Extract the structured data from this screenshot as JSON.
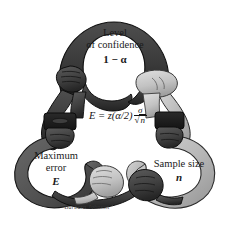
{
  "figure": {
    "background_color": "#ffffff",
    "width": 229,
    "height": 230,
    "signature": "Barbara Johnson"
  },
  "nodes": {
    "confidence": {
      "line1": "Level",
      "line2": "of confidence",
      "symbol": "1 − α",
      "loop_color": "#3a3a3a",
      "loop_shadow": "#1d1d1d"
    },
    "error": {
      "line1": "Maximum",
      "line2": "error",
      "symbol": "E",
      "loop_color": "#565656",
      "loop_shadow": "#2c2c2c"
    },
    "sample": {
      "line1": "Sample size",
      "line2": "",
      "symbol": "n",
      "loop_color": "#b8b8b8",
      "loop_shadow": "#8e8e8e"
    }
  },
  "formula": {
    "lhs": "E",
    "equals": "=",
    "z_term": "z(α/2)",
    "numerator": "σ",
    "radical": "√",
    "denominator_radicand": "n",
    "full_text": "E = z(α/2) σ/√n"
  },
  "hands": {
    "top_left": {
      "name": "dark-fist",
      "skin": "#4a4a4a"
    },
    "top_right": {
      "name": "light-hand",
      "skin": "#c9c9c9"
    },
    "mid_left": {
      "name": "dark-cuff-hand",
      "skin": "#3c3c3c"
    },
    "mid_right": {
      "name": "dark-cuff-hand",
      "skin": "#2e2e2e"
    },
    "bottom_left": {
      "name": "light-hand",
      "skin": "#c9c9c9"
    },
    "bottom_right": {
      "name": "dark-hand",
      "skin": "#3a3a3a"
    }
  },
  "palette": {
    "ink": "#1a1a1a",
    "dark_arm": "#3a3a3a",
    "mid_arm": "#565656",
    "light_arm": "#b8b8b8",
    "outline": "#111111",
    "page": "#ffffff"
  }
}
